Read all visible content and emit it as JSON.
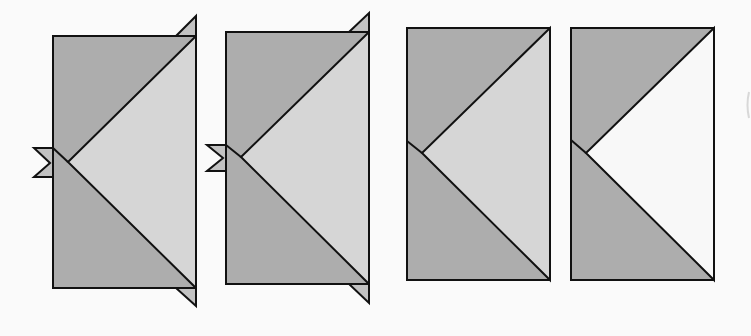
{
  "diagram": {
    "type": "quilt-flying-geese-assembly-steps",
    "background": "#fafafa",
    "stroke_color": "#111111",
    "colors": {
      "dark_gray": "#adadad",
      "light_gray": "#d6d6d6",
      "white": "#f8f8f8",
      "tab_fill": "#c2c2c2"
    },
    "panels": [
      {
        "id": "step-1",
        "rect": {
          "x": 53,
          "y": 36,
          "w": 143,
          "h": 252
        },
        "center_point": {
          "x": 68,
          "y": 162
        },
        "left_edge_point": {
          "x": 53,
          "y": 148
        },
        "center_fill": "light_gray",
        "tabs": [
          {
            "name": "top-right-tab",
            "points": "176,36 196,16 196,36"
          },
          {
            "name": "bottom-right-tab",
            "points": "176,288 196,288 196,306"
          },
          {
            "name": "left-tab",
            "points": "53,148 34,148 50,163 34,177 53,177"
          }
        ]
      },
      {
        "id": "step-2",
        "rect": {
          "x": 226,
          "y": 32,
          "w": 143,
          "h": 252
        },
        "center_point": {
          "x": 241,
          "y": 157
        },
        "left_edge_point": {
          "x": 226,
          "y": 145
        },
        "center_fill": "light_gray",
        "tabs": [
          {
            "name": "top-right-tab",
            "points": "349,32 369,13 369,32"
          },
          {
            "name": "bottom-right-tab",
            "points": "349,284 369,284 369,303"
          },
          {
            "name": "left-tab",
            "points": "226,145 207,145 223,158 207,171 226,171"
          }
        ]
      },
      {
        "id": "step-3",
        "rect": {
          "x": 407,
          "y": 28,
          "w": 143,
          "h": 252
        },
        "center_point": {
          "x": 422,
          "y": 153
        },
        "left_edge_point": {
          "x": 407,
          "y": 141
        },
        "center_fill": "light_gray",
        "tabs": []
      },
      {
        "id": "step-4",
        "rect": {
          "x": 571,
          "y": 28,
          "w": 143,
          "h": 252
        },
        "center_point": {
          "x": 586,
          "y": 153
        },
        "left_edge_point": {
          "x": 571,
          "y": 140
        },
        "center_fill": "white",
        "tabs": []
      }
    ],
    "edge_mark": {
      "x": 749,
      "y1": 92,
      "y2": 118
    }
  }
}
